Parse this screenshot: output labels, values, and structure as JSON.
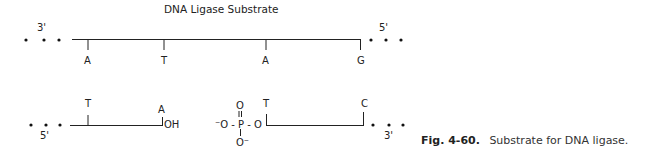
{
  "title": "DNA Ligase Substrate",
  "top_strand": {
    "left_end": "3'",
    "right_end": "5'",
    "bases": [
      "A",
      "T",
      "A",
      "G"
    ]
  },
  "bottom_strand": {
    "left_end": "5'",
    "right_end": "3'",
    "left_segment_bases": [
      "T",
      "A"
    ],
    "left_segment_terminus": "OH",
    "right_segment_bases": [
      "T",
      "C"
    ]
  },
  "phosphate": {
    "top_oxygen": "O",
    "double_bond": "=",
    "left": "⁻O - P - O",
    "bottom_oxygen": "O⁻"
  },
  "caption": {
    "label": "Fig. 4-60.",
    "text": "Substrate for DNA ligase."
  }
}
